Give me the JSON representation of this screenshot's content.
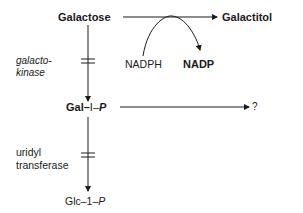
{
  "diagram": {
    "type": "metabolic-pathway",
    "nodes": {
      "galactose": "Galactose",
      "galactitol": "Galactitol",
      "gal1p": {
        "prefix": "Gal",
        "mid": "I",
        "p": "P"
      },
      "glc1p": {
        "prefix": "Glc",
        "mid": "1",
        "p": "P"
      },
      "unknown": "?"
    },
    "cofactors": {
      "nadph": "NADPH",
      "nadp": "NADP"
    },
    "enzymes": {
      "galactokinase": [
        "galacto-",
        "kinase"
      ],
      "uridyl_transferase": [
        "uridyl",
        "transferase"
      ]
    },
    "edges": [
      {
        "from": "Galactose",
        "to": "Galactitol",
        "cofactor_in": "NADPH",
        "cofactor_out": "NADP"
      },
      {
        "from": "Galactose",
        "to": "Gal-I-P",
        "enzyme": "galactokinase",
        "blocked_marker": true
      },
      {
        "from": "Gal-I-P",
        "to": "?"
      },
      {
        "from": "Gal-I-P",
        "to": "Glc-1-P",
        "enzyme": "uridyl transferase",
        "blocked_marker": true
      }
    ],
    "colors": {
      "ink": "#1a1a1a",
      "background": "#ffffff"
    }
  }
}
